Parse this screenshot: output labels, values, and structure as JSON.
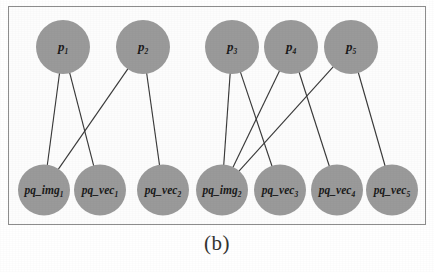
{
  "figure": {
    "caption": "(b)",
    "frame_color": "#8d8d8d",
    "node_color": "#9a9a9a",
    "edge_color": "#3a3a3a"
  },
  "graph": {
    "type": "bipartite-diagram",
    "top_nodes": [
      {
        "id": "p1",
        "base": "p",
        "sub": "1",
        "cx": 63,
        "cy": 47,
        "r": 27
      },
      {
        "id": "p2",
        "base": "p",
        "sub": "2",
        "cx": 143,
        "cy": 47,
        "r": 27
      },
      {
        "id": "p3",
        "base": "p",
        "sub": "3",
        "cx": 232,
        "cy": 47,
        "r": 27
      },
      {
        "id": "p4",
        "base": "p",
        "sub": "4",
        "cx": 291,
        "cy": 47,
        "r": 27
      },
      {
        "id": "p5",
        "base": "p",
        "sub": "5",
        "cx": 351,
        "cy": 47,
        "r": 27
      }
    ],
    "bottom_nodes": [
      {
        "id": "img1",
        "base": "pq_img",
        "sub": "1",
        "cx": 44,
        "cy": 190,
        "r": 26
      },
      {
        "id": "vec1",
        "base": "pq_vec",
        "sub": "1",
        "cx": 100,
        "cy": 190,
        "r": 26
      },
      {
        "id": "vec2",
        "base": "pq_vec",
        "sub": "2",
        "cx": 163,
        "cy": 190,
        "r": 26
      },
      {
        "id": "img2",
        "base": "pq_img",
        "sub": "2",
        "cx": 222,
        "cy": 190,
        "r": 26
      },
      {
        "id": "vec3",
        "base": "pq_vec",
        "sub": "3",
        "cx": 280,
        "cy": 190,
        "r": 26
      },
      {
        "id": "vec4",
        "base": "pq_vec",
        "sub": "4",
        "cx": 337,
        "cy": 190,
        "r": 26
      },
      {
        "id": "vec5",
        "base": "pq_vec",
        "sub": "5",
        "cx": 392,
        "cy": 190,
        "r": 26
      }
    ],
    "edges": [
      {
        "from": "p1",
        "to": "img1"
      },
      {
        "from": "p1",
        "to": "vec1"
      },
      {
        "from": "p2",
        "to": "img1"
      },
      {
        "from": "p2",
        "to": "vec2"
      },
      {
        "from": "p3",
        "to": "img2"
      },
      {
        "from": "p3",
        "to": "vec3"
      },
      {
        "from": "p4",
        "to": "img2"
      },
      {
        "from": "p4",
        "to": "vec4"
      },
      {
        "from": "p5",
        "to": "img2"
      },
      {
        "from": "p5",
        "to": "vec5"
      }
    ]
  }
}
